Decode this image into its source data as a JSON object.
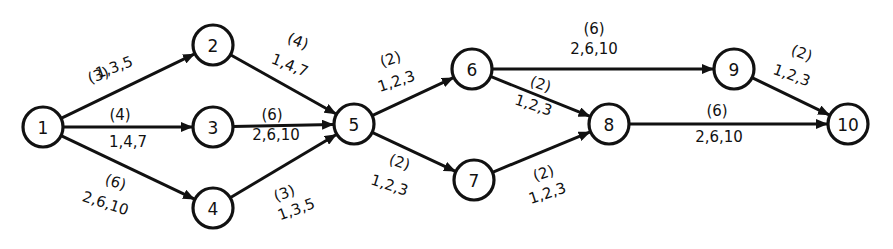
{
  "diagram": {
    "type": "activity-on-arrow network",
    "nodes": [
      {
        "id": "1",
        "label": "1",
        "x": 43,
        "y": 127
      },
      {
        "id": "2",
        "label": "2",
        "x": 213,
        "y": 45
      },
      {
        "id": "3",
        "label": "3",
        "x": 213,
        "y": 127
      },
      {
        "id": "4",
        "label": "4",
        "x": 213,
        "y": 208
      },
      {
        "id": "5",
        "label": "5",
        "x": 354,
        "y": 124
      },
      {
        "id": "6",
        "label": "6",
        "x": 472,
        "y": 69
      },
      {
        "id": "7",
        "label": "7",
        "x": 474,
        "y": 180
      },
      {
        "id": "8",
        "label": "8",
        "x": 609,
        "y": 124
      },
      {
        "id": "9",
        "label": "9",
        "x": 734,
        "y": 69
      },
      {
        "id": "10",
        "label": "10",
        "x": 848,
        "y": 124
      }
    ],
    "edges": [
      {
        "from": "1",
        "to": "2",
        "duration": "(3)",
        "estimates": "1,3,5",
        "lx1": 100,
        "ly1": 80,
        "lx2": 116,
        "ly2": 72,
        "rot": -20
      },
      {
        "from": "1",
        "to": "3",
        "duration": "(4)",
        "estimates": "1,4,7",
        "lx1": 120,
        "ly1": 120,
        "lx2": 128,
        "ly2": 147,
        "rot": 0
      },
      {
        "from": "1",
        "to": "4",
        "duration": "(6)",
        "estimates": "2,6,10",
        "lx1": 114,
        "ly1": 187,
        "lx2": 104,
        "ly2": 208,
        "rot": 18
      },
      {
        "from": "2",
        "to": "5",
        "duration": "(4)",
        "estimates": "1,4,7",
        "lx1": 296,
        "ly1": 46,
        "lx2": 288,
        "ly2": 70,
        "rot": 22
      },
      {
        "from": "3",
        "to": "5",
        "duration": "(6)",
        "estimates": "2,6,10",
        "lx1": 272,
        "ly1": 120,
        "lx2": 276,
        "ly2": 140,
        "rot": 0
      },
      {
        "from": "4",
        "to": "5",
        "duration": "(3)",
        "estimates": "1,3,5",
        "lx1": 286,
        "ly1": 198,
        "lx2": 298,
        "ly2": 214,
        "rot": -20
      },
      {
        "from": "5",
        "to": "6",
        "duration": "(2)",
        "estimates": "1,2,3",
        "lx1": 392,
        "ly1": 64,
        "lx2": 398,
        "ly2": 86,
        "rot": -18
      },
      {
        "from": "5",
        "to": "7",
        "duration": "(2)",
        "estimates": "1,2,3",
        "lx1": 398,
        "ly1": 167,
        "lx2": 388,
        "ly2": 190,
        "rot": 18
      },
      {
        "from": "6",
        "to": "8",
        "duration": "(2)",
        "estimates": "1,2,3",
        "lx1": 539,
        "ly1": 89,
        "lx2": 532,
        "ly2": 110,
        "rot": 18
      },
      {
        "from": "6",
        "to": "9",
        "duration": "(6)",
        "estimates": "2,6,10",
        "lx1": 594,
        "ly1": 34,
        "lx2": 594,
        "ly2": 54,
        "rot": 0
      },
      {
        "from": "7",
        "to": "8",
        "duration": "(2)",
        "estimates": "1,2,3",
        "lx1": 545,
        "ly1": 178,
        "lx2": 549,
        "ly2": 198,
        "rot": -18
      },
      {
        "from": "8",
        "to": "10",
        "duration": "(6)",
        "estimates": "2,6,10",
        "lx1": 717,
        "ly1": 116,
        "lx2": 719,
        "ly2": 142,
        "rot": 0
      },
      {
        "from": "9",
        "to": "10",
        "duration": "(2)",
        "estimates": "1,2,3",
        "lx1": 800,
        "ly1": 58,
        "lx2": 790,
        "ly2": 80,
        "rot": 20
      }
    ],
    "node_radius": 20
  }
}
